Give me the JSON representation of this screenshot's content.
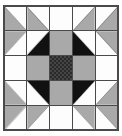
{
  "figure": {
    "width": 122,
    "height": 136
  },
  "palette": {
    "white": "#fdfdfd",
    "gray": "#a9a9a9",
    "black": "#111111",
    "checker_dark": "#2a2a2a",
    "checker_light": "#454545",
    "seam": "#4a4a4a",
    "background": "#ffffff"
  },
  "block": {
    "rows": 5,
    "columns": 5,
    "cells": [
      {
        "row": 0,
        "col": 0,
        "type": "half-square-triangle",
        "triangle": "bl",
        "triangle_color": "gray",
        "background": "white"
      },
      {
        "row": 0,
        "col": 1,
        "type": "half-square-triangle",
        "triangle": "bl",
        "triangle_color": "gray",
        "background": "white"
      },
      {
        "row": 0,
        "col": 2,
        "type": "solid",
        "triangle": "",
        "triangle_color": "",
        "background": "white"
      },
      {
        "row": 0,
        "col": 3,
        "type": "half-square-triangle",
        "triangle": "br",
        "triangle_color": "gray",
        "background": "white"
      },
      {
        "row": 0,
        "col": 4,
        "type": "half-square-triangle",
        "triangle": "br",
        "triangle_color": "gray",
        "background": "white"
      },
      {
        "row": 1,
        "col": 0,
        "type": "half-square-triangle",
        "triangle": "tl",
        "triangle_color": "gray",
        "background": "white"
      },
      {
        "row": 1,
        "col": 1,
        "type": "half-square-triangle",
        "triangle": "br",
        "triangle_color": "black",
        "background": "white"
      },
      {
        "row": 1,
        "col": 2,
        "type": "solid",
        "triangle": "",
        "triangle_color": "",
        "background": "gray"
      },
      {
        "row": 1,
        "col": 3,
        "type": "half-square-triangle",
        "triangle": "bl",
        "triangle_color": "black",
        "background": "white"
      },
      {
        "row": 1,
        "col": 4,
        "type": "half-square-triangle",
        "triangle": "tr",
        "triangle_color": "gray",
        "background": "white"
      },
      {
        "row": 2,
        "col": 0,
        "type": "solid",
        "triangle": "",
        "triangle_color": "",
        "background": "white"
      },
      {
        "row": 2,
        "col": 1,
        "type": "solid",
        "triangle": "",
        "triangle_color": "",
        "background": "gray"
      },
      {
        "row": 2,
        "col": 2,
        "type": "checkered",
        "triangle": "",
        "triangle_color": "",
        "background": "checker"
      },
      {
        "row": 2,
        "col": 3,
        "type": "solid",
        "triangle": "",
        "triangle_color": "",
        "background": "gray"
      },
      {
        "row": 2,
        "col": 4,
        "type": "solid",
        "triangle": "",
        "triangle_color": "",
        "background": "white"
      },
      {
        "row": 3,
        "col": 0,
        "type": "half-square-triangle",
        "triangle": "bl",
        "triangle_color": "gray",
        "background": "white"
      },
      {
        "row": 3,
        "col": 1,
        "type": "half-square-triangle",
        "triangle": "tr",
        "triangle_color": "black",
        "background": "white"
      },
      {
        "row": 3,
        "col": 2,
        "type": "solid",
        "triangle": "",
        "triangle_color": "",
        "background": "gray"
      },
      {
        "row": 3,
        "col": 3,
        "type": "half-square-triangle",
        "triangle": "tl",
        "triangle_color": "black",
        "background": "white"
      },
      {
        "row": 3,
        "col": 4,
        "type": "half-square-triangle",
        "triangle": "br",
        "triangle_color": "gray",
        "background": "white"
      },
      {
        "row": 4,
        "col": 0,
        "type": "half-square-triangle",
        "triangle": "tl",
        "triangle_color": "gray",
        "background": "white"
      },
      {
        "row": 4,
        "col": 1,
        "type": "half-square-triangle",
        "triangle": "tl",
        "triangle_color": "gray",
        "background": "white"
      },
      {
        "row": 4,
        "col": 2,
        "type": "solid",
        "triangle": "",
        "triangle_color": "",
        "background": "white"
      },
      {
        "row": 4,
        "col": 3,
        "type": "half-square-triangle",
        "triangle": "tr",
        "triangle_color": "gray",
        "background": "white"
      },
      {
        "row": 4,
        "col": 4,
        "type": "half-square-triangle",
        "triangle": "tr",
        "triangle_color": "gray",
        "background": "white"
      }
    ]
  }
}
